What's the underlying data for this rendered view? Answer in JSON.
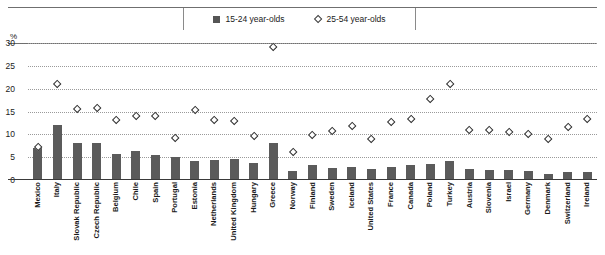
{
  "legend": {
    "items": [
      {
        "label": "15-24 year-olds",
        "marker": "filled-square-icon",
        "color": "#555555"
      },
      {
        "label": "25-54 year-olds",
        "marker": "open-diamond-icon",
        "color": "#ffffff"
      }
    ]
  },
  "axis": {
    "unit_label": "%",
    "yticks": [
      "0",
      "5",
      "10",
      "15",
      "20",
      "25",
      "30"
    ]
  },
  "chart_data": {
    "type": "bar",
    "title": "",
    "xlabel": "",
    "ylabel": "%",
    "ylim": [
      0,
      30
    ],
    "yticks": [
      0,
      5,
      10,
      15,
      20,
      25,
      30
    ],
    "grid": true,
    "legend_position": "top-center",
    "categories": [
      "Mexico",
      "Italy",
      "Slovak Republic",
      "Czech Republic",
      "Belgium",
      "Chile",
      "Spain",
      "Portugal",
      "Estonia",
      "Netherlands",
      "United Kingdom",
      "Hungary",
      "Greece",
      "Norway",
      "Finland",
      "Sweden",
      "Iceland",
      "United States",
      "France",
      "Canada",
      "Poland",
      "Turkey",
      "Austria",
      "Slovenia",
      "Israel",
      "Germany",
      "Denmark",
      "Switzerland",
      "Ireland"
    ],
    "series": [
      {
        "name": "15-24 year-olds",
        "marker": "bar",
        "values": [
          7.0,
          12.0,
          8.0,
          8.0,
          5.8,
          6.4,
          5.5,
          5.0,
          4.2,
          4.3,
          4.6,
          3.8,
          8.0,
          1.9,
          3.3,
          2.6,
          2.9,
          2.4,
          2.8,
          3.3,
          3.5,
          4.2,
          2.4,
          2.2,
          2.1,
          1.9,
          1.3,
          1.7,
          1.8
        ]
      },
      {
        "name": "25-54 year-olds",
        "marker": "open-diamond",
        "values": [
          7.2,
          21.0,
          15.5,
          15.8,
          13.2,
          14.0,
          14.0,
          9.2,
          15.3,
          13.0,
          12.8,
          9.7,
          29.0,
          6.0,
          9.8,
          10.6,
          11.8,
          8.9,
          12.6,
          13.4,
          17.8,
          21.0,
          11.0,
          11.0,
          10.4,
          10.0,
          9.0,
          11.6,
          13.4
        ]
      }
    ]
  }
}
